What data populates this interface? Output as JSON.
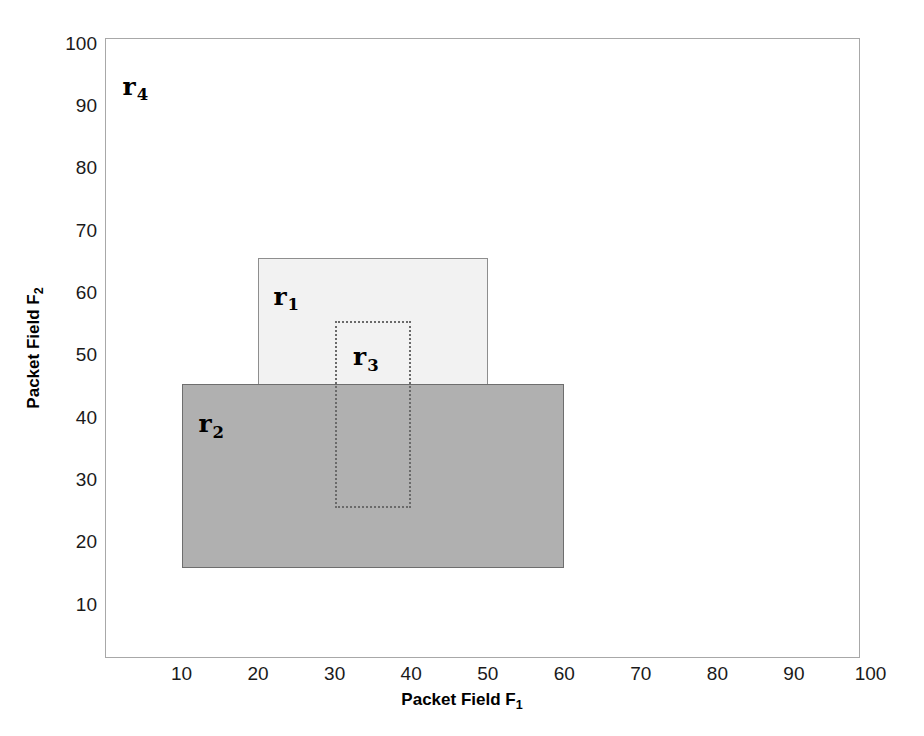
{
  "chart_data": {
    "type": "scatter",
    "title": "",
    "xlabel": "Packet Field F",
    "xlabel_sub": "1",
    "ylabel": "Packet Field F",
    "ylabel_sub": "2",
    "xlim": [
      0,
      100
    ],
    "ylim": [
      0,
      100
    ],
    "grid": false,
    "legend": "none",
    "xticks": [
      10,
      20,
      30,
      40,
      50,
      60,
      70,
      80,
      90,
      100
    ],
    "yticks": [
      10,
      20,
      30,
      40,
      50,
      60,
      70,
      80,
      90,
      100
    ],
    "xtick_labels": [
      "10",
      "20",
      "30",
      "40",
      "50",
      "60",
      "70",
      "80",
      "90",
      "100"
    ],
    "ytick_labels": [
      "10",
      "20",
      "30",
      "40",
      "50",
      "60",
      "70",
      "80",
      "90",
      "100"
    ],
    "rectangles": [
      {
        "name": "r1",
        "label": "r",
        "subscript": "1",
        "x0": 20,
        "y0": 35.6,
        "x1": 50,
        "y1": 65.6,
        "fill": "#f2f2f2",
        "stroke": "#8e8e8e",
        "linestyle": "solid",
        "label_x": 22.0,
        "label_y": 61.5
      },
      {
        "name": "r2",
        "label": "r",
        "subscript": "2",
        "x0": 10,
        "y0": 15.9,
        "x1": 60,
        "y1": 45.4,
        "fill": "#b0b0b0",
        "stroke": "#6e6e6e",
        "linestyle": "solid",
        "label_x": 12.2,
        "label_y": 41.0
      },
      {
        "name": "r3",
        "label": "r",
        "subscript": "3",
        "x0": 30,
        "y0": 25.5,
        "x1": 40,
        "y1": 55.6,
        "fill": "none",
        "stroke": "#6a6a6a",
        "linestyle": "dotted",
        "label_x": 32.4,
        "label_y": 51.8
      },
      {
        "name": "r4",
        "label": "r",
        "subscript": "4",
        "x0": 0,
        "y0": 0,
        "x1": 100,
        "y1": 100,
        "fill": "none",
        "stroke": "#a8a8a8",
        "linestyle": "solid",
        "label_x": 2.3,
        "label_y": 95.2
      }
    ]
  },
  "axes": {
    "frame_color": "#a8a8a8"
  }
}
